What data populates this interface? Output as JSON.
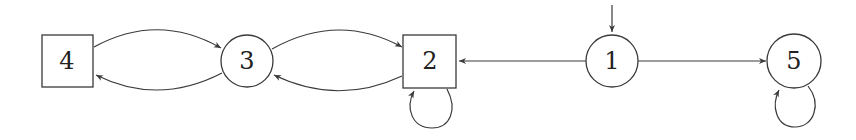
{
  "diagram": {
    "type": "state-transition-graph",
    "colors": {
      "stroke": "#3a3a3a",
      "text": "#222222",
      "background": "#ffffff"
    },
    "nodes": [
      {
        "id": "4",
        "label": "4",
        "shape": "square",
        "x": 67,
        "y": 61
      },
      {
        "id": "3",
        "label": "3",
        "shape": "circle",
        "x": 247,
        "y": 61
      },
      {
        "id": "2",
        "label": "2",
        "shape": "square",
        "x": 430,
        "y": 61
      },
      {
        "id": "1",
        "label": "1",
        "shape": "circle",
        "x": 612,
        "y": 61,
        "initial": true
      },
      {
        "id": "5",
        "label": "5",
        "shape": "circle",
        "x": 794,
        "y": 61
      }
    ],
    "edges": [
      {
        "from": "4",
        "to": "3"
      },
      {
        "from": "3",
        "to": "4"
      },
      {
        "from": "3",
        "to": "2"
      },
      {
        "from": "2",
        "to": "3"
      },
      {
        "from": "2",
        "to": "2",
        "self_loop": true
      },
      {
        "from": "1",
        "to": "2"
      },
      {
        "from": "1",
        "to": "5"
      },
      {
        "from": "5",
        "to": "5",
        "self_loop": true
      }
    ]
  }
}
